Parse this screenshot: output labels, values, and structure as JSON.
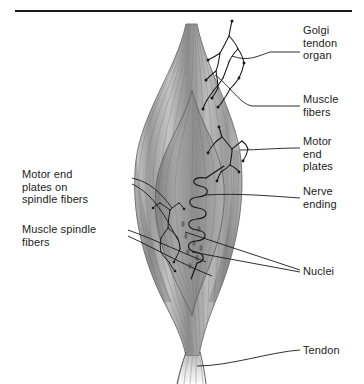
{
  "figure": {
    "background_color": "#ffffff",
    "rule_color": "#1a1a1a",
    "label_color": "#222222",
    "leader_line_color": "#1a1a1a",
    "muscle_gray_light": "#d8d8d8",
    "muscle_gray_mid": "#a8a8a8",
    "muscle_gray_dark": "#7a7a7a",
    "tendon_gray": "#ededed"
  },
  "labels": {
    "golgi_tendon_organ": "Golgi\ntendon\norgan",
    "muscle_fibers": "Muscle\nfibers",
    "motor_end_plates": "Motor\nend\nplates",
    "nerve_ending": "Nerve\nending",
    "nuclei": "Nuclei",
    "tendon": "Tendon",
    "motor_end_plates_on_spindle_fibers": "Motor end\nplates on\nspindle fibers",
    "muscle_spindle_fibers": "Muscle spindle\nfibers"
  }
}
